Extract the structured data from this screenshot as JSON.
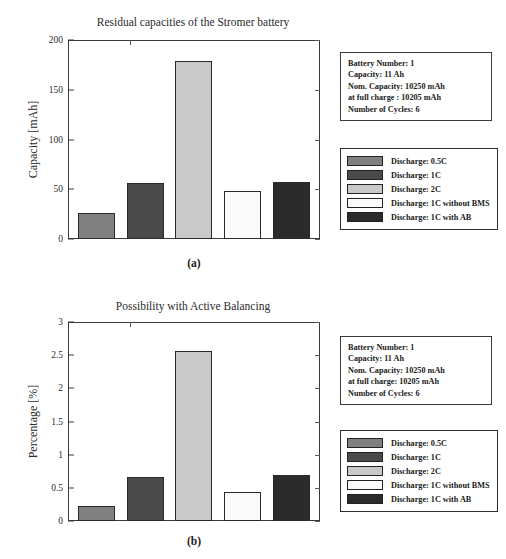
{
  "colors": {
    "bar_05c": "#808080",
    "bar_1c": "#4a4a4a",
    "bar_2c": "#c9c9c9",
    "bar_1c_no_bms": "#fbfbfb",
    "bar_1c_ab": "#2b2b2b",
    "frame": "#3a3a3a",
    "text": "#1a1a1a"
  },
  "panel_a": {
    "subcaption": "(a)",
    "info_box": {
      "lines": [
        "Battery Number: 1",
        "Capacity:   11 Ah",
        "Nom. Capacity: 10250 mAh",
        "at full charge : 10205 mAh",
        "Number of Cycles: 6"
      ]
    },
    "legend": {
      "items": [
        {
          "label": "Discharge:  0.5C",
          "swatch": "#808080"
        },
        {
          "label": "Discharge:  1C",
          "swatch": "#4a4a4a"
        },
        {
          "label": "Discharge:  2C",
          "swatch": "#c9c9c9"
        },
        {
          "label": "Discharge:  1C without BMS",
          "swatch": "#fbfbfb"
        },
        {
          "label": "Discharge:  1C with AB",
          "swatch": "#2b2b2b"
        }
      ]
    }
  },
  "panel_b": {
    "subcaption": "(b)",
    "info_box": {
      "lines": [
        "Battery Number: 1",
        "Capacity:   11 Ah",
        "Nom. Capacity: 10250 mAh",
        "at full charge: 10205 mAh",
        "Number of Cycles: 6"
      ]
    },
    "legend": {
      "items": [
        {
          "label": "Discharge:  0.5C",
          "swatch": "#808080"
        },
        {
          "label": "Discharge:  1C",
          "swatch": "#4a4a4a"
        },
        {
          "label": "Discharge:  2C",
          "swatch": "#c9c9c9"
        },
        {
          "label": "Discharge:  1C without BMS",
          "swatch": "#fbfbfb"
        },
        {
          "label": "Discharge:  1C with AB",
          "swatch": "#2b2b2b"
        }
      ]
    }
  },
  "bottom_caption": "",
  "chart_data": [
    {
      "type": "bar",
      "id": "a",
      "title": "Residual capacities of the Stromer battery",
      "xlabel": "",
      "ylabel": "Capacity [mAh]",
      "ylim": [
        0,
        200
      ],
      "yticks": [
        0,
        50,
        100,
        150,
        200
      ],
      "ytick_labels": [
        "0",
        "50",
        "100",
        "150",
        "200"
      ],
      "grid": false,
      "legend_position": "right",
      "categories": [
        "Discharge:  0.5C",
        "Discharge:  1C",
        "Discharge:  2C",
        "Discharge:  1C without BMS",
        "Discharge:  1C with AB"
      ],
      "values": [
        26,
        56,
        179,
        48,
        57
      ],
      "colors": [
        "#808080",
        "#4a4a4a",
        "#c9c9c9",
        "#fbfbfb",
        "#2b2b2b"
      ]
    },
    {
      "type": "bar",
      "id": "b",
      "title": "Possibility with Active Balancing",
      "xlabel": "",
      "ylabel": "Percentage [%]",
      "ylim": [
        0,
        3
      ],
      "yticks": [
        0,
        0.5,
        1,
        1.5,
        2,
        2.5,
        3
      ],
      "ytick_labels": [
        "0",
        "0.5",
        "1",
        "1.5",
        "2",
        "2.5",
        "3"
      ],
      "grid": false,
      "legend_position": "right",
      "categories": [
        "Discharge:  0.5C",
        "Discharge:  1C",
        "Discharge:  2C",
        "Discharge:  1C without BMS",
        "Discharge:  1C with AB"
      ],
      "values": [
        0.23,
        0.66,
        2.56,
        0.44,
        0.69
      ],
      "colors": [
        "#808080",
        "#4a4a4a",
        "#c9c9c9",
        "#fbfbfb",
        "#2b2b2b"
      ]
    }
  ]
}
